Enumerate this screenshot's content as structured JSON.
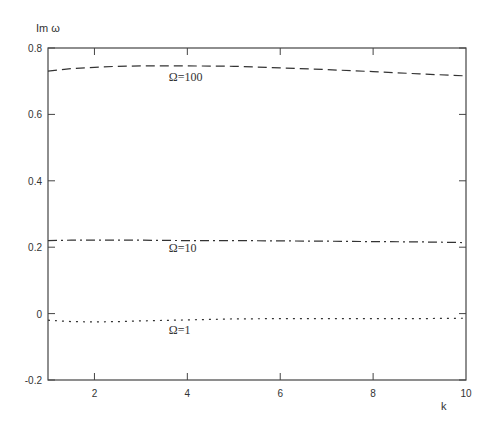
{
  "chart_data": {
    "type": "line",
    "title": "",
    "xlabel": "k",
    "ylabel": "Im ω",
    "xlim": [
      1,
      10
    ],
    "ylim": [
      -0.2,
      0.8
    ],
    "grid": false,
    "legend_position": "inline labels",
    "x_ticks": [
      2,
      4,
      6,
      8,
      10
    ],
    "x_tick_labels": [
      "2",
      "4",
      "6",
      "8",
      "10"
    ],
    "y_ticks": [
      -0.2,
      0,
      0.2,
      0.4,
      0.6,
      0.8
    ],
    "y_tick_labels": [
      "-0.2",
      "0",
      "0.2",
      "0.4",
      "0.6",
      "0.8"
    ],
    "x": [
      1,
      1.5,
      2,
      2.5,
      3,
      4,
      5,
      6,
      7,
      8,
      9,
      10
    ],
    "series": [
      {
        "name": "Ω=100",
        "style": "dashed",
        "values": [
          0.73,
          0.738,
          0.742,
          0.745,
          0.746,
          0.746,
          0.745,
          0.74,
          0.735,
          0.729,
          0.722,
          0.716
        ],
        "label_pos": {
          "x": 3.6,
          "y": 0.7
        }
      },
      {
        "name": "Ω=10",
        "style": "dashdot",
        "values": [
          0.22,
          0.221,
          0.221,
          0.221,
          0.221,
          0.22,
          0.22,
          0.219,
          0.218,
          0.217,
          0.216,
          0.214
        ],
        "label_pos": {
          "x": 3.6,
          "y": 0.185
        }
      },
      {
        "name": "Ω=1",
        "style": "dotted",
        "values": [
          -0.02,
          -0.024,
          -0.025,
          -0.024,
          -0.022,
          -0.019,
          -0.016,
          -0.015,
          -0.015,
          -0.015,
          -0.015,
          -0.014
        ],
        "label_pos": {
          "x": 3.6,
          "y": -0.06
        }
      }
    ]
  }
}
